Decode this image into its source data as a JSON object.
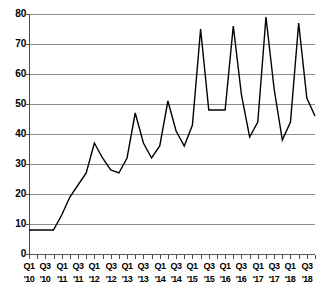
{
  "chart_data": {
    "type": "line",
    "title": "",
    "subtitle": "",
    "xlabel": "",
    "ylabel": "",
    "ylim": [
      0,
      80
    ],
    "yticks": [
      0,
      10,
      20,
      30,
      40,
      50,
      60,
      70,
      80
    ],
    "grid": true,
    "legend": null,
    "series_name": "Quarterly value",
    "line_color": "#000000",
    "grid_color": "#8c8c8c",
    "axis_color": "#4d4d4d",
    "x": [
      "Q1 '10",
      "Q2 '10",
      "Q3 '10",
      "Q4 '10",
      "Q1 '11",
      "Q2 '11",
      "Q3 '11",
      "Q4 '11",
      "Q1 '12",
      "Q2 '12",
      "Q3 '12",
      "Q4 '12",
      "Q1 '13",
      "Q2 '13",
      "Q3 '13",
      "Q4 '13",
      "Q1 '14",
      "Q2 '14",
      "Q3 '14",
      "Q4 '14",
      "Q1 '15",
      "Q2 '15",
      "Q3 '15",
      "Q4 '15",
      "Q1 '16",
      "Q2 '16",
      "Q3 '16",
      "Q4 '16",
      "Q1 '17",
      "Q2 '17",
      "Q3 '17",
      "Q4 '17",
      "Q1 '18",
      "Q2 '18",
      "Q3 '18",
      "Q4 '18"
    ],
    "values": [
      8,
      8,
      8,
      8,
      13,
      19,
      23,
      27,
      37,
      32,
      28,
      27,
      32,
      47,
      37,
      32,
      36,
      51,
      41,
      36,
      43,
      75,
      48,
      48,
      48,
      76,
      53,
      39,
      44,
      79,
      55,
      38,
      44,
      77,
      52,
      46
    ],
    "xticks": [
      {
        "q": "Q1",
        "yr": "'10",
        "index": 0
      },
      {
        "q": "Q3",
        "yr": "'10",
        "index": 2
      },
      {
        "q": "Q1",
        "yr": "'11",
        "index": 4
      },
      {
        "q": "Q3",
        "yr": "'11",
        "index": 6
      },
      {
        "q": "Q1",
        "yr": "'12",
        "index": 8
      },
      {
        "q": "Q3",
        "yr": "'12",
        "index": 10
      },
      {
        "q": "Q1",
        "yr": "'13",
        "index": 12
      },
      {
        "q": "Q3",
        "yr": "'13",
        "index": 14
      },
      {
        "q": "Q1",
        "yr": "'14",
        "index": 16
      },
      {
        "q": "Q3",
        "yr": "'14",
        "index": 18
      },
      {
        "q": "Q1",
        "yr": "'15",
        "index": 20
      },
      {
        "q": "Q3",
        "yr": "'15",
        "index": 22
      },
      {
        "q": "Q1",
        "yr": "'16",
        "index": 24
      },
      {
        "q": "Q3",
        "yr": "'16",
        "index": 26
      },
      {
        "q": "Q1",
        "yr": "'17",
        "index": 28
      },
      {
        "q": "Q3",
        "yr": "'17",
        "index": 30
      },
      {
        "q": "Q1",
        "yr": "'18",
        "index": 32
      },
      {
        "q": "Q3",
        "yr": "'18",
        "index": 34
      }
    ]
  }
}
